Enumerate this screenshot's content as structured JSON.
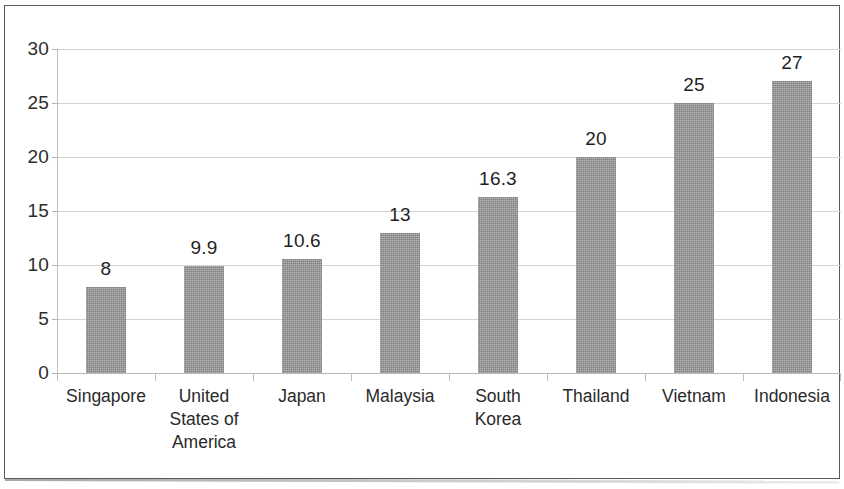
{
  "chart_data": {
    "type": "bar",
    "title": "",
    "subtitle": "",
    "xlabel": "",
    "ylabel": "",
    "categories": [
      "Singapore",
      "United States of America",
      "Japan",
      "Malaysia",
      "South Korea",
      "Thailand",
      "Vietnam",
      "Indonesia"
    ],
    "category_lines": [
      [
        "Singapore"
      ],
      [
        "United",
        "States of",
        "America"
      ],
      [
        "Japan"
      ],
      [
        "Malaysia"
      ],
      [
        "South",
        "Korea"
      ],
      [
        "Thailand"
      ],
      [
        "Vietnam"
      ],
      [
        "Indonesia"
      ]
    ],
    "values": [
      8,
      9.9,
      10.6,
      13,
      16.3,
      20,
      25,
      27
    ],
    "data_labels": [
      "8",
      "9.9",
      "10.6",
      "13",
      "16.3",
      "20",
      "25",
      "27"
    ],
    "ylim": [
      0,
      30
    ],
    "ytick_labels": [
      "0",
      "5",
      "10",
      "15",
      "20",
      "25",
      "30"
    ],
    "ytick_values": [
      0,
      5,
      10,
      15,
      20,
      25,
      30
    ],
    "grid": "horizontal",
    "legend": "none",
    "bar_color": "#949494",
    "gridline_color": "#d2d2d2",
    "axis_color": "#c3c3c3",
    "text_color": "#2d2d2d",
    "frame_color": "#555a5e",
    "background_color": "#ffffff"
  }
}
